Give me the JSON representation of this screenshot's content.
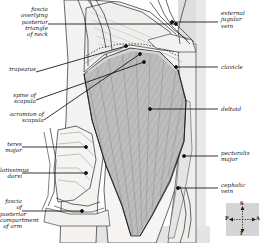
{
  "figure": {
    "background_color": "#ffffff",
    "muscle_fill_color": "#b9b9b9",
    "skin_fill_color": "#f2f2f0",
    "background_panel_color": "#dcdcdc",
    "line_color": "#1a1a1a"
  },
  "labels_left": [
    {
      "id": "fascia-neck",
      "text": "fascia\noverlying\nposterior\ntriangle\nof neck"
    },
    {
      "id": "trapezius",
      "text": "trapezius"
    },
    {
      "id": "spine-of-scapula",
      "text": "spine of\nscapula"
    },
    {
      "id": "acromion",
      "text": "acromion of\nscapula"
    },
    {
      "id": "teres-major",
      "text": "teres\nmajor"
    },
    {
      "id": "latissimus-dorsi",
      "text": "latissimus\ndorsi"
    },
    {
      "id": "fascia-arm",
      "text": "fascia of\nposterior\ncompartment\nof arm"
    }
  ],
  "labels_right": [
    {
      "id": "external-jugular-vein",
      "text": "external\njugular\nvein"
    },
    {
      "id": "clavicle",
      "text": "clavicle"
    },
    {
      "id": "deltoid",
      "text": "deltoid"
    },
    {
      "id": "pectoralis-major",
      "text": "pectoralis\nmajor"
    },
    {
      "id": "cephalic-vein",
      "text": "cephalic\nvein"
    }
  ],
  "compass": {
    "superior": "S",
    "inferior": "I",
    "anterior": "A",
    "posterior": "P"
  }
}
